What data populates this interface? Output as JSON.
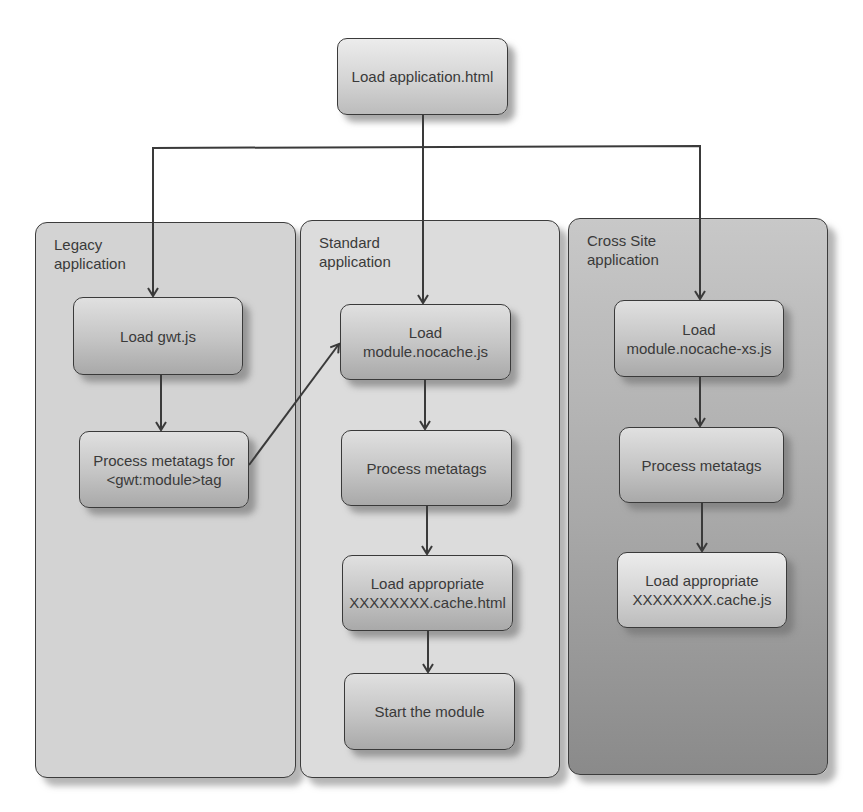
{
  "diagram": {
    "type": "flowchart",
    "root": {
      "label": "Load application.html"
    },
    "panels": [
      {
        "title": "Legacy\napplication",
        "steps": [
          {
            "label": "Load gwt.js"
          },
          {
            "label": "Process metatags for\n<gwt:module>tag"
          }
        ]
      },
      {
        "title": "Standard\napplication",
        "steps": [
          {
            "label": "Load\nmodule.nocache.js"
          },
          {
            "label": "Process metatags"
          },
          {
            "label": "Load appropriate\nXXXXXXXX.cache.html"
          },
          {
            "label": "Start the module"
          }
        ]
      },
      {
        "title": "Cross Site\napplication",
        "steps": [
          {
            "label": "Load\nmodule.nocache-xs.js"
          },
          {
            "label": "Process metatags"
          },
          {
            "label": "Load appropriate\nXXXXXXXX.cache.js"
          }
        ]
      }
    ],
    "edges": [
      {
        "from": "Load application.html",
        "to": "Load gwt.js"
      },
      {
        "from": "Load application.html",
        "to": "Load\nmodule.nocache.js"
      },
      {
        "from": "Load application.html",
        "to": "Load\nmodule.nocache-xs.js"
      },
      {
        "from": "Load gwt.js",
        "to": "Process metatags for\n<gwt:module>tag"
      },
      {
        "from": "Process metatags for\n<gwt:module>tag",
        "to": "Load\nmodule.nocache.js"
      },
      {
        "from": "Load\nmodule.nocache.js",
        "to": "Process metatags"
      },
      {
        "from": "Process metatags",
        "to": "Load appropriate\nXXXXXXXX.cache.html"
      },
      {
        "from": "Load appropriate\nXXXXXXXX.cache.html",
        "to": "Start the module"
      },
      {
        "from": "Load\nmodule.nocache-xs.js",
        "to": "Process metatags"
      },
      {
        "from": "Process metatags",
        "to": "Load appropriate\nXXXXXXXX.cache.js"
      }
    ],
    "colors": {
      "stroke": "#3a3a3a",
      "node_fill_top": "#e0e0e0",
      "node_fill_bottom": "#a9a9a9",
      "legacy_panel": "#d3d3d3",
      "standard_panel": "#dcdcdc",
      "cross_site_panel_bottom": "#8a8a8a"
    }
  }
}
